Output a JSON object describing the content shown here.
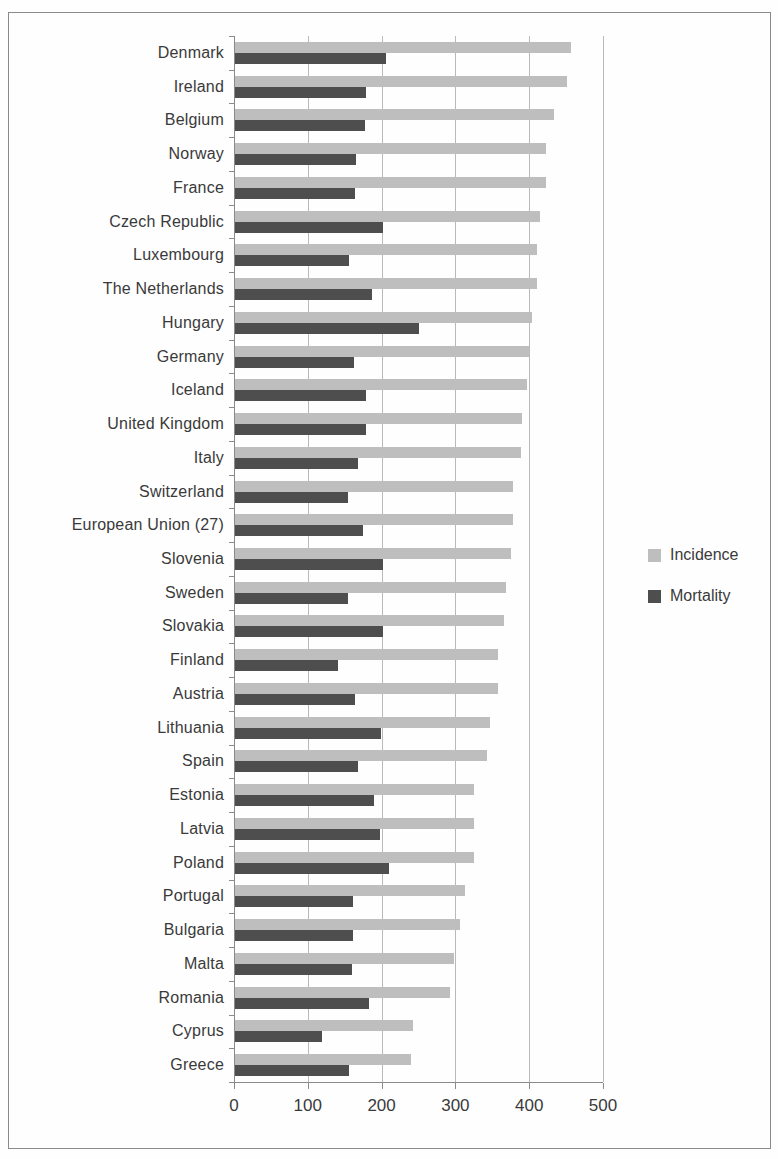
{
  "chart_data": {
    "type": "bar",
    "orientation": "horizontal",
    "title": "",
    "xlabel": "",
    "ylabel": "",
    "xlim": [
      0,
      500
    ],
    "xticks": [
      0,
      100,
      200,
      300,
      400,
      500
    ],
    "grid": true,
    "legend_position": "right",
    "categories": [
      "Denmark",
      "Ireland",
      "Belgium",
      "Norway",
      "France",
      "Czech Republic",
      "Luxembourg",
      "The Netherlands",
      "Hungary",
      "Germany",
      "Iceland",
      "United Kingdom",
      "Italy",
      "Switzerland",
      "European Union (27)",
      "Slovenia",
      "Sweden",
      "Slovakia",
      "Finland",
      "Austria",
      "Lithuania",
      "Spain",
      "Estonia",
      "Latvia",
      "Poland",
      "Portugal",
      "Bulgaria",
      "Malta",
      "Romania",
      "Cyprus",
      "Greece"
    ],
    "series": [
      {
        "name": "Incidence",
        "color": "#bebebe",
        "values": [
          455,
          450,
          432,
          422,
          422,
          413,
          409,
          409,
          402,
          398,
          395,
          389,
          387,
          377,
          377,
          374,
          367,
          365,
          357,
          356,
          345,
          341,
          324,
          324,
          324,
          311,
          305,
          297,
          291,
          241,
          238
        ]
      },
      {
        "name": "Mortality",
        "color": "#4e4e4e",
        "values": [
          205,
          178,
          176,
          164,
          162,
          200,
          154,
          186,
          249,
          161,
          178,
          178,
          166,
          153,
          174,
          201,
          153,
          201,
          140,
          163,
          198,
          166,
          189,
          197,
          208,
          160,
          160,
          159,
          182,
          118,
          155
        ]
      }
    ],
    "colors": {
      "gridline": "#b9b9b9",
      "axis": "#8a8a8a",
      "text": "#3a3a3a",
      "frame_border": "#8a8a8a"
    }
  }
}
